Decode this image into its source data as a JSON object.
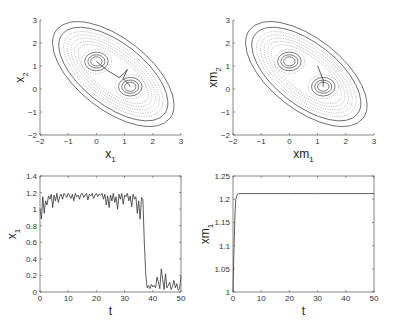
{
  "chart_data": [
    {
      "id": "tl",
      "type": "contour",
      "title": "",
      "xlabel": "x_1",
      "ylabel": "x_2",
      "xlabel_main": "x",
      "xlabel_sub": "1",
      "ylabel_main": "x",
      "ylabel_sub": "2",
      "xlim": [
        -2,
        3
      ],
      "ylim": [
        -2,
        3
      ],
      "xticks": [
        -2,
        -1,
        0,
        1,
        2,
        3
      ],
      "yticks": [
        -2,
        -1,
        0,
        1,
        2,
        3
      ],
      "wells": [
        [
          0,
          1.2
        ],
        [
          1.2,
          0.1
        ]
      ],
      "trajectory": [
        [
          0,
          1.2
        ],
        [
          0.4,
          0.8
        ],
        [
          0.8,
          0.5
        ],
        [
          1.0,
          0.7
        ],
        [
          1.1,
          0.85
        ],
        [
          0.95,
          0.45
        ],
        [
          1.15,
          0.2
        ],
        [
          1.2,
          0.1
        ]
      ],
      "frame": {
        "x0": 40,
        "x1": 181,
        "y0": 20,
        "y1": 135
      }
    },
    {
      "id": "tr",
      "type": "contour",
      "title": "",
      "xlabel": "xm_1",
      "ylabel": "xm_2",
      "xlabel_main": "xm",
      "xlabel_sub": "1",
      "ylabel_main": "xm",
      "ylabel_sub": "2",
      "xlim": [
        -2,
        3
      ],
      "ylim": [
        -2,
        3
      ],
      "xticks": [
        -2,
        -1,
        0,
        1,
        2,
        3
      ],
      "yticks": [
        -2,
        -1,
        0,
        1,
        2,
        3
      ],
      "wells": [
        [
          0,
          1.2
        ],
        [
          1.2,
          0.1
        ]
      ],
      "trajectory": [
        [
          1.0,
          1.0
        ],
        [
          1.1,
          0.7
        ],
        [
          1.2,
          0.4
        ],
        [
          1.2,
          0.1
        ]
      ],
      "frame": {
        "x0": 233,
        "x1": 374,
        "y0": 20,
        "y1": 135
      }
    },
    {
      "id": "bl",
      "type": "line",
      "title": "",
      "xlabel": "t",
      "ylabel": "x_1",
      "ylabel_main": "x",
      "ylabel_sub": "1",
      "xlim": [
        0,
        50
      ],
      "ylim": [
        0,
        1.4
      ],
      "xticks": [
        0,
        10,
        20,
        30,
        40,
        50
      ],
      "yticks": [
        0,
        0.2,
        0.4,
        0.6,
        0.8,
        1,
        1.2,
        1.4
      ],
      "ytick_labels": [
        "0",
        "0.2",
        "0.4",
        "0.6",
        "0.8",
        "1",
        "1.2",
        "1.4"
      ],
      "x": [
        0,
        0.5,
        1,
        1.5,
        2,
        2.5,
        3,
        3.5,
        4,
        4.5,
        5,
        5.5,
        6,
        6.5,
        7,
        7.5,
        8,
        8.5,
        9,
        9.5,
        10,
        10.5,
        11,
        11.5,
        12,
        12.5,
        13,
        13.5,
        14,
        14.5,
        15,
        15.5,
        16,
        16.5,
        17,
        17.5,
        18,
        18.5,
        19,
        19.5,
        20,
        20.5,
        21,
        21.5,
        22,
        22.5,
        23,
        23.5,
        24,
        24.5,
        25,
        25.5,
        26,
        26.5,
        27,
        27.5,
        28,
        28.5,
        29,
        29.5,
        30,
        30.5,
        31,
        31.5,
        32,
        32.5,
        33,
        33.5,
        34,
        34.5,
        35,
        35.5,
        36,
        36.5,
        37,
        37.5,
        38,
        38.5,
        39,
        39.5,
        40,
        40.5,
        41,
        41.5,
        42,
        42.5,
        43,
        43.5,
        44,
        44.5,
        45,
        45.5,
        46,
        46.5,
        47,
        47.5,
        48,
        48.5,
        49,
        49.5,
        50
      ],
      "values": [
        1.0,
        0.88,
        1.15,
        0.95,
        1.1,
        1.05,
        1.16,
        1.12,
        1.18,
        1.02,
        1.17,
        1.1,
        1.19,
        1.08,
        1.15,
        1.18,
        1.12,
        1.19,
        1.17,
        1.14,
        1.19,
        1.16,
        1.13,
        1.18,
        1.1,
        1.19,
        1.15,
        1.17,
        1.12,
        1.18,
        1.19,
        1.14,
        1.17,
        1.19,
        1.11,
        1.18,
        1.16,
        1.19,
        1.13,
        1.17,
        1.19,
        1.15,
        1.18,
        1.17,
        1.19,
        1.12,
        1.18,
        1.05,
        1.16,
        1.02,
        1.17,
        1.1,
        1.19,
        1.08,
        1.15,
        1.0,
        1.18,
        1.12,
        1.19,
        1.06,
        1.17,
        1.15,
        1.19,
        1.1,
        1.16,
        1.03,
        1.18,
        1.12,
        1.15,
        0.95,
        1.1,
        0.88,
        1.14,
        1.12,
        0.6,
        0.2,
        0.05,
        0.08,
        0.04,
        0.09,
        0.06,
        0.08,
        0.05,
        0.18,
        0.12,
        0.04,
        0.28,
        0.15,
        0.03,
        0.22,
        0.05,
        0.08,
        0.12,
        0.03,
        0.07,
        0.14,
        0.05,
        0.1,
        0.02,
        0.04,
        0.19
      ],
      "frame": {
        "x0": 40,
        "x1": 181,
        "y0": 176,
        "y1": 292
      }
    },
    {
      "id": "br",
      "type": "line",
      "title": "",
      "xlabel": "t",
      "ylabel": "xm_1",
      "ylabel_main": "xm",
      "ylabel_sub": "1",
      "xlim": [
        0,
        50
      ],
      "ylim": [
        1,
        1.25
      ],
      "xticks": [
        0,
        10,
        20,
        30,
        40,
        50
      ],
      "yticks": [
        1,
        1.05,
        1.1,
        1.15,
        1.2,
        1.25
      ],
      "ytick_labels": [
        "1",
        "1.05",
        "1.1",
        "1.15",
        "1.2",
        "1.25"
      ],
      "x": [
        0,
        0.3,
        0.7,
        1.0,
        1.5,
        2.0,
        5,
        10,
        20,
        30,
        40,
        50
      ],
      "values": [
        1.0,
        1.08,
        1.17,
        1.2,
        1.21,
        1.212,
        1.212,
        1.212,
        1.212,
        1.212,
        1.212,
        1.212
      ],
      "frame": {
        "x0": 233,
        "x1": 374,
        "y0": 176,
        "y1": 292
      }
    }
  ],
  "colors": {
    "axis": "#555555",
    "line": "#333333",
    "contour_solid": "#444444",
    "contour_dotted": "#888888"
  }
}
